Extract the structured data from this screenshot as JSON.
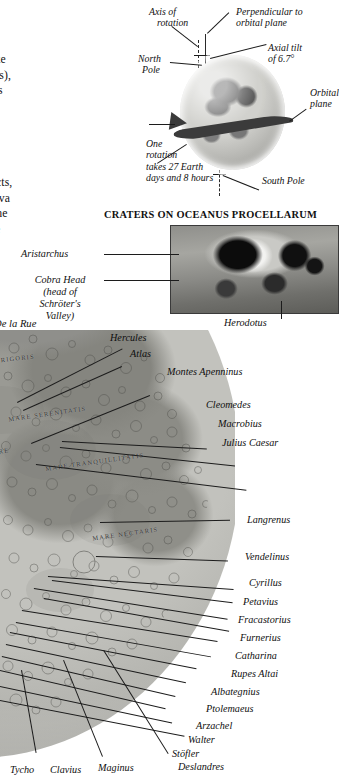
{
  "body_copy": {
    "lines": [
      "ral satellite.",
      " a diameter",
      "arter that of",
      " time to rotate",
      "th (27.3 days),",
      " always faces",
      "ace we can",
      "ds on how",
      "nd barren,",
      " rock,",
      " surface is",
      "eorite impacts,",
      " solidified lava",
      " mainly on the",
      "Many of the",
      "rater walls"
    ]
  },
  "credit": {
    "label": "De la Rue"
  },
  "globe_diagram": {
    "labels": {
      "axis_of_rotation": "Axis of\nrotation",
      "axis_of_rotation_l1": "Axis of",
      "axis_of_rotation_l2": "rotation",
      "perpendicular_l1": "Perpendicular to",
      "perpendicular_l2": "orbital plane",
      "axial_tilt_l1": "Axial tilt",
      "axial_tilt_l2": "of 6.7°",
      "north_pole_l1": "North",
      "north_pole_l2": "Pole",
      "orbital_plane_l1": "Orbital",
      "orbital_plane_l2": "plane",
      "one_rotation_l1": "One",
      "one_rotation_l2": "rotation",
      "one_rotation_l3": "takes 27 Earth",
      "one_rotation_l4": "days and 8 hours",
      "south_pole": "South Pole"
    }
  },
  "craters_section": {
    "title": "CRATERS ON OCEANUS PROCELLARUM",
    "labels": {
      "aristarchus": "Aristarchus",
      "cobra_head_l1": "Cobra Head",
      "cobra_head_l2": "(head of",
      "cobra_head_l3": "Schröter's",
      "cobra_head_l4": "Valley)",
      "herodotus": "Herodotus"
    }
  },
  "moon_map": {
    "mare_labels": [
      "MARE FRIGORIS",
      "MARE SERENITATIS",
      "MARE TRANQUILLITATIS",
      "MARE NECTARIS",
      "MARE",
      "ACI"
    ],
    "right_labels": [
      "Hercules",
      "Atlas",
      "Montes Apenninus",
      "Cleomedes",
      "Macrobius",
      "Julius Caesar",
      "Langrenus",
      "Vendelinus",
      "Cyrillus",
      "Petavius",
      "Fracastorius",
      "Furnerius",
      "Catharina",
      "Rupes Altai",
      "Albategnius",
      "Ptolemaeus",
      "Arzachel",
      "Walter",
      "Stöfler",
      "Deslandres"
    ],
    "bottom_labels": [
      "Tycho",
      "Clavius",
      "Maginus"
    ]
  },
  "colors": {
    "ink": "#111111",
    "rule": "#1c1c1c",
    "moon_light": "#c2c2bd",
    "moon_dark": "#7e7e79",
    "band": "#3b3b3b"
  }
}
